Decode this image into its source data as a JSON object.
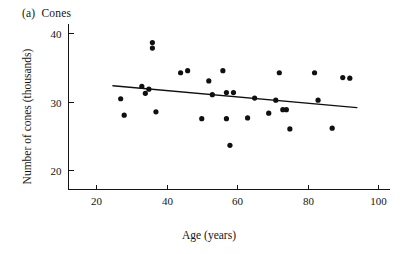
{
  "figure": {
    "panel_tag": "(a)",
    "panel_title": "Cones",
    "background_color": "#ffffff",
    "ink_color": "#141414"
  },
  "chart_data": {
    "type": "scatter",
    "xlabel": "Age (years)",
    "ylabel": "Number of cones (thousands)",
    "xlim": [
      12,
      103
    ],
    "ylim": [
      17.2,
      41.5
    ],
    "xticks": [
      20,
      40,
      60,
      80,
      100
    ],
    "xticklabels": [
      "20",
      "40",
      "60",
      "80",
      "100"
    ],
    "yticks": [
      20,
      30,
      40
    ],
    "yticklabels": [
      "20",
      "30",
      "40"
    ],
    "grid": false,
    "legend": null,
    "marker": "filled-circle",
    "marker_color": "#101010",
    "series": [
      {
        "name": "Cones",
        "x": [
          27,
          28,
          33,
          34,
          35,
          36,
          36,
          37,
          44,
          46,
          50,
          52,
          53,
          56,
          57,
          57,
          58,
          59,
          63,
          65,
          69,
          71,
          72,
          73,
          74,
          75,
          82,
          83,
          87,
          90,
          92
        ],
        "y": [
          30.4,
          28.0,
          32.2,
          31.2,
          31.8,
          37.8,
          38.6,
          28.5,
          34.2,
          34.5,
          27.5,
          33.0,
          31.0,
          34.5,
          31.3,
          27.5,
          23.6,
          31.3,
          27.6,
          30.5,
          28.3,
          30.2,
          34.2,
          28.8,
          28.8,
          26.0,
          34.2,
          30.2,
          26.1,
          33.5,
          33.4
        ]
      }
    ],
    "fit_line": {
      "name": "least-squares regression line",
      "x_start": 24.8,
      "y_start": 32.3,
      "x_end": 94.0,
      "y_end": 29.1,
      "color": "#101010"
    }
  }
}
